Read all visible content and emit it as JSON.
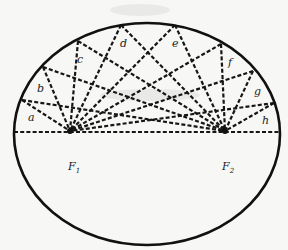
{
  "diagram": {
    "ellipse": {
      "cx": 147,
      "cy": 134,
      "rx": 133,
      "ry": 111
    },
    "foci": [
      {
        "id": "F1",
        "label": "F",
        "sub": "1",
        "x": 70,
        "y": 131,
        "label_x": 68,
        "label_y": 170
      },
      {
        "id": "F2",
        "label": "F",
        "sub": "2",
        "x": 225,
        "y": 131,
        "label_x": 222,
        "label_y": 170
      }
    ],
    "rim_points": [
      {
        "id": "a",
        "label": "a",
        "x": 22,
        "y": 100,
        "label_x": 28,
        "label_y": 121
      },
      {
        "id": "b",
        "label": "b",
        "x": 43,
        "y": 67,
        "label_x": 37,
        "label_y": 92
      },
      {
        "id": "c",
        "label": "c",
        "x": 78,
        "y": 41,
        "label_x": 77,
        "label_y": 63
      },
      {
        "id": "d",
        "label": "d",
        "x": 121,
        "y": 25,
        "label_x": 120,
        "label_y": 47
      },
      {
        "id": "e",
        "label": "e",
        "x": 175,
        "y": 25,
        "label_x": 172,
        "label_y": 47
      },
      {
        "id": "f",
        "label": "f",
        "x": 221,
        "y": 44,
        "label_x": 228,
        "label_y": 66
      },
      {
        "id": "g",
        "label": "g",
        "x": 253,
        "y": 71,
        "label_x": 254,
        "label_y": 95
      },
      {
        "id": "h",
        "label": "h",
        "x": 274,
        "y": 103,
        "label_x": 262,
        "label_y": 124
      }
    ],
    "axis_endpoints": {
      "left_x": 14,
      "right_x": 280,
      "y": 132
    }
  }
}
